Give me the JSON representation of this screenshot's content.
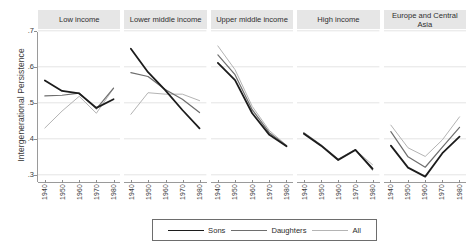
{
  "chart_data": {
    "type": "line",
    "title": "",
    "subtitle": "",
    "xlabel": "",
    "ylabel": "Intergenerational Persistence",
    "x": [
      1940,
      1950,
      1960,
      1970,
      1980
    ],
    "xtick_labels": [
      "1940",
      "1950",
      "1960",
      "1970",
      "1980"
    ],
    "ytick_labels": [
      ".7",
      ".6",
      ".5",
      ".4",
      ".3"
    ],
    "ytick_values": [
      0.7,
      0.6,
      0.5,
      0.4,
      0.3
    ],
    "ylim": [
      0.28,
      0.705
    ],
    "xlim": [
      1936,
      1984
    ],
    "grid": "horizontal-only",
    "legend_position": "bottom-center",
    "legend": [
      {
        "name": "Sons",
        "color": "#1c1c1c",
        "width": 1.8
      },
      {
        "name": "Daughters",
        "color": "#6e6e6e",
        "width": 1.2
      },
      {
        "name": "All",
        "color": "#b4b4b4",
        "width": 1.0
      }
    ],
    "panels": [
      {
        "label": "Low income",
        "series": [
          {
            "name": "Sons",
            "values": [
              0.562,
              0.533,
              0.526,
              0.486,
              0.51
            ]
          },
          {
            "name": "Daughters",
            "values": [
              0.519,
              0.521,
              0.527,
              0.483,
              0.541
            ]
          },
          {
            "name": "All",
            "values": [
              0.43,
              0.477,
              0.518,
              0.471,
              0.54
            ]
          }
        ]
      },
      {
        "label": "Lower middle income",
        "series": [
          {
            "name": "Sons",
            "values": [
              0.65,
              0.585,
              0.535,
              0.48,
              0.429
            ]
          },
          {
            "name": "Daughters",
            "values": [
              0.584,
              0.573,
              0.537,
              0.51,
              0.473
            ]
          },
          {
            "name": "All",
            "values": [
              0.468,
              0.528,
              0.524,
              0.524,
              0.506
            ]
          }
        ]
      },
      {
        "label": "Upper middle income",
        "series": [
          {
            "name": "Sons",
            "values": [
              0.611,
              0.563,
              0.471,
              0.411,
              0.379
            ]
          },
          {
            "name": "Daughters",
            "values": [
              0.633,
              0.578,
              0.481,
              0.417,
              0.381
            ]
          },
          {
            "name": "All",
            "values": [
              0.658,
              0.592,
              0.49,
              0.423,
              0.382
            ]
          }
        ]
      },
      {
        "label": "High income",
        "series": [
          {
            "name": "Sons",
            "values": [
              0.414,
              0.381,
              0.341,
              0.369,
              0.317
            ]
          },
          {
            "name": "Daughters",
            "values": [
              0.417,
              0.383,
              0.343,
              0.37,
              0.314
            ]
          },
          {
            "name": "All",
            "values": [
              0.416,
              0.382,
              0.342,
              0.369,
              0.328
            ]
          }
        ]
      },
      {
        "label": "Europe and Central Asia",
        "series": [
          {
            "name": "Sons",
            "values": [
              0.381,
              0.32,
              0.295,
              0.36,
              0.406
            ]
          },
          {
            "name": "Daughters",
            "values": [
              0.42,
              0.35,
              0.321,
              0.377,
              0.432
            ]
          },
          {
            "name": "All",
            "values": [
              0.438,
              0.375,
              0.351,
              0.397,
              0.461
            ]
          }
        ]
      }
    ]
  }
}
